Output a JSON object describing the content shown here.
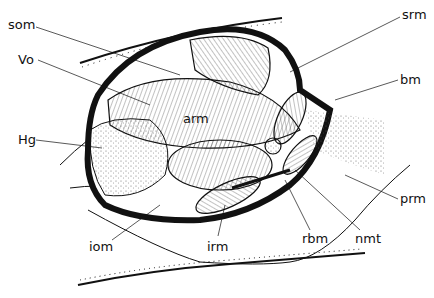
{
  "figure": {
    "type": "anatomical line drawing",
    "colors": {
      "ink": "#111111",
      "background": "#ffffff",
      "stipple": "#555555"
    }
  },
  "labels": [
    {
      "id": "som",
      "text": "som",
      "x": 8,
      "y": 18
    },
    {
      "id": "vo",
      "text": "Vo",
      "x": 18,
      "y": 53
    },
    {
      "id": "srm",
      "text": "srm",
      "x": 402,
      "y": 8
    },
    {
      "id": "bm",
      "text": "bm",
      "x": 400,
      "y": 73
    },
    {
      "id": "arm",
      "text": "arm",
      "x": 183,
      "y": 112
    },
    {
      "id": "hg",
      "text": "Hg",
      "x": 18,
      "y": 133
    },
    {
      "id": "prm",
      "text": "prm",
      "x": 400,
      "y": 192
    },
    {
      "id": "iom",
      "text": "iom",
      "x": 89,
      "y": 240
    },
    {
      "id": "irm",
      "text": "irm",
      "x": 207,
      "y": 240
    },
    {
      "id": "rbm",
      "text": "rbm",
      "x": 302,
      "y": 232
    },
    {
      "id": "nmt",
      "text": "nmt",
      "x": 355,
      "y": 232
    }
  ]
}
